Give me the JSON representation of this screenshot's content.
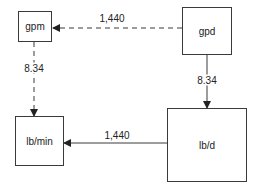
{
  "diagram": {
    "nodes": [
      {
        "id": "gpm",
        "label": "gpm"
      },
      {
        "id": "gpd",
        "label": "gpd"
      },
      {
        "id": "lbmin",
        "label": "lb/min"
      },
      {
        "id": "lbd",
        "label": "lb/d"
      }
    ],
    "edges": [
      {
        "from": "gpd",
        "to": "gpm",
        "label": "1,440",
        "style": "dashed"
      },
      {
        "from": "gpm",
        "to": "lbmin",
        "label": "8.34",
        "style": "dashed"
      },
      {
        "from": "gpd",
        "to": "lbd",
        "label": "8.34",
        "style": "solid"
      },
      {
        "from": "lbd",
        "to": "lbmin",
        "label": "1,440",
        "style": "solid"
      }
    ],
    "colors": {
      "line": "#3a3a3a",
      "text": "#222222",
      "background": "#ffffff"
    }
  }
}
